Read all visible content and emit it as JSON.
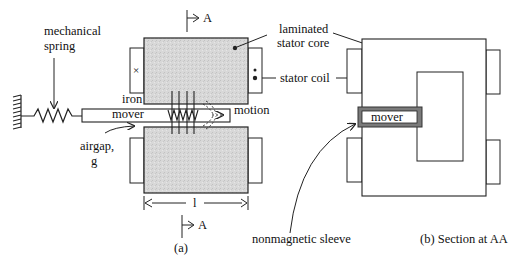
{
  "figure": {
    "part_a": {
      "caption": "(a)",
      "labels": {
        "mechanical_spring_line1": "mechanical",
        "mechanical_spring_line2": "spring",
        "iron": "iron",
        "mover": "mover",
        "motion": "motion",
        "airgap_line1": "airgap,",
        "airgap_line2": "g",
        "length": "l",
        "section_marker_top": "A",
        "section_marker_bottom": "A",
        "coil_left_symbol": "×",
        "coil_right_symbol": "•"
      }
    },
    "part_b": {
      "caption": "(b) Section at AA",
      "labels": {
        "mover": "mover"
      }
    },
    "callouts": {
      "laminated_line1": "laminated",
      "laminated_line2": "stator core",
      "stator_coil": "stator coil",
      "nonmagnetic_sleeve": "nonmagnetic sleeve"
    },
    "colors": {
      "core_fill": "#d6d6d6",
      "sleeve_fill": "#7a7a7a",
      "line": "#222222",
      "background": "#ffffff"
    }
  }
}
